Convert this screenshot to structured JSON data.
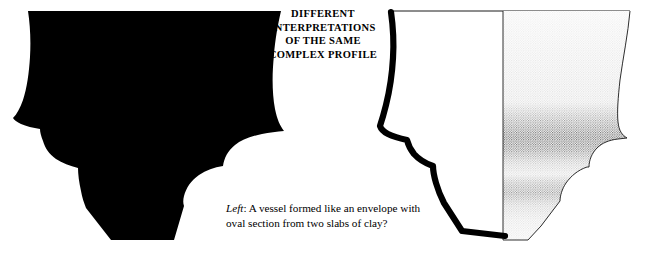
{
  "page": {
    "background_color": "#ffffff",
    "ink_color": "#000000",
    "width": 649,
    "height": 257
  },
  "title": {
    "lines": [
      "DIFFERENT",
      "INTERPRETATIONS",
      "OF THE SAME",
      "COMPLEX PROFILE"
    ]
  },
  "caption": {
    "lead": "Left",
    "lead_suffix": ":",
    "line1_rest": " A vessel formed like an envelope with",
    "line2": "oval section from two slabs of clay?",
    "full_text": "Left: A vessel formed like an envelope with oval section from two slabs of clay?"
  },
  "figures": {
    "left": {
      "name": "solid-black-vessel-silhouette",
      "description": "Solid black filled silhouette of a complex-profile vessel, carinated shoulder and angled base",
      "fill": "#000000"
    },
    "right": {
      "name": "vessel-profile-section-drawing",
      "description": "Archaeological profile drawing: thick black section line on the left half, stippled shaded exterior on the right half, vertical centre line",
      "outline_color": "#000000",
      "stipple_color": "#3a3a3a",
      "rim_line_color": "#000000"
    }
  }
}
